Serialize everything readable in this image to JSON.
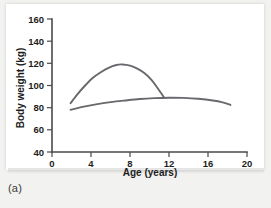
{
  "figure": {
    "caption": "(a)",
    "background_color": "#f2f2f0",
    "plate_color": "#ffffff"
  },
  "chart_data": {
    "type": "line",
    "title": "",
    "xlabel": "Age (years)",
    "ylabel": "Body weight (kg)",
    "xlim": [
      0,
      20
    ],
    "ylim": [
      40,
      160
    ],
    "xticks": [
      0,
      4,
      8,
      12,
      16,
      20
    ],
    "yticks": [
      40,
      60,
      80,
      100,
      120,
      140,
      160
    ],
    "xtick_labels": [
      "0",
      "4",
      "8",
      "12",
      "16",
      "20"
    ],
    "ytick_labels": [
      "40",
      "60",
      "80",
      "100",
      "120",
      "140",
      "160"
    ],
    "grid": false,
    "legend": null,
    "line_color": "#68686d",
    "axis_color": "#4a4a4a",
    "series": [
      {
        "name": "upper-curve",
        "color": "#68686d",
        "x": [
          1.9,
          2.6,
          3.4,
          4.2,
          5.0,
          5.8,
          6.6,
          7.2,
          8.0,
          8.8,
          9.5,
          10.2,
          10.8,
          11.2,
          11.5
        ],
        "values": [
          84,
          92,
          100,
          107,
          112,
          116,
          118.5,
          119,
          118,
          115,
          111,
          105,
          98,
          93,
          89
        ]
      },
      {
        "name": "lower-curve",
        "color": "#68686d",
        "x": [
          1.9,
          3.0,
          4.5,
          6.0,
          7.5,
          9.0,
          10.5,
          12.0,
          13.5,
          15.0,
          16.5,
          17.5,
          18.3
        ],
        "values": [
          78,
          80.5,
          83,
          85,
          86.5,
          87.8,
          88.6,
          89,
          88.8,
          88,
          86.5,
          84.8,
          82.5
        ]
      }
    ]
  }
}
